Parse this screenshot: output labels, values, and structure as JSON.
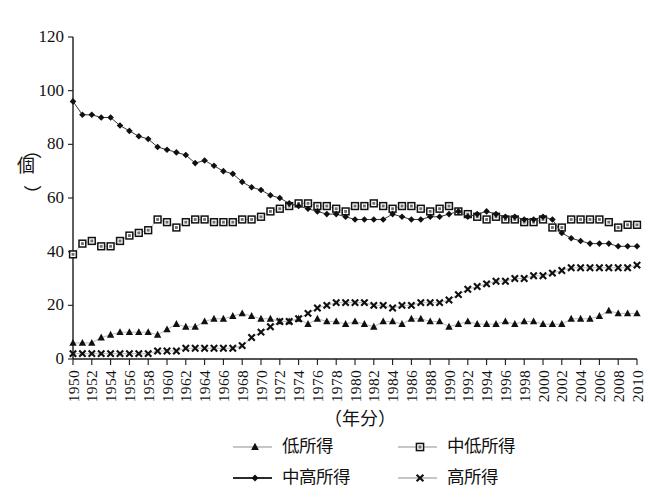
{
  "chart_data": {
    "type": "line",
    "title": "",
    "xlabel": "（年分）",
    "ylabel": "（個）",
    "ylim": [
      0,
      120
    ],
    "ytick_values": [
      0,
      20,
      40,
      60,
      80,
      100,
      120
    ],
    "xlim": [
      1950,
      2010
    ],
    "xtick_labels": [
      "1950",
      "1952",
      "1954",
      "1956",
      "1958",
      "1960",
      "1962",
      "1964",
      "1966",
      "1968",
      "1970",
      "1972",
      "1974",
      "1976",
      "1978",
      "1980",
      "1982",
      "1984",
      "1986",
      "1988",
      "1990",
      "1992",
      "1994",
      "1996",
      "1998",
      "2000",
      "2002",
      "2004",
      "2006",
      "2008",
      "2010"
    ],
    "grid": false,
    "legend_position": "bottom",
    "x": [
      1950,
      1951,
      1952,
      1953,
      1954,
      1955,
      1956,
      1957,
      1958,
      1959,
      1960,
      1961,
      1962,
      1963,
      1964,
      1965,
      1966,
      1967,
      1968,
      1969,
      1970,
      1971,
      1972,
      1973,
      1974,
      1975,
      1976,
      1977,
      1978,
      1979,
      1980,
      1981,
      1982,
      1983,
      1984,
      1985,
      1986,
      1987,
      1988,
      1989,
      1990,
      1991,
      1992,
      1993,
      1994,
      1995,
      1996,
      1997,
      1998,
      1999,
      2000,
      2001,
      2002,
      2003,
      2004,
      2005,
      2006,
      2007,
      2008,
      2009,
      2010
    ],
    "series": [
      {
        "name": "低所得",
        "marker": "triangle",
        "values": [
          6,
          6,
          6,
          8,
          9,
          10,
          10,
          10,
          10,
          9,
          11,
          13,
          12,
          12,
          14,
          15,
          15,
          16,
          17,
          16,
          15,
          15,
          14,
          14,
          15,
          13,
          15,
          14,
          14,
          13,
          14,
          13,
          12,
          14,
          14,
          13,
          15,
          15,
          14,
          14,
          12,
          13,
          14,
          13,
          13,
          13,
          14,
          13,
          14,
          14,
          13,
          13,
          13,
          15,
          15,
          15,
          16,
          18,
          17,
          17,
          17
        ]
      },
      {
        "name": "中低所得",
        "marker": "square",
        "values": [
          39,
          43,
          44,
          42,
          42,
          44,
          46,
          47,
          48,
          52,
          51,
          49,
          51,
          52,
          52,
          51,
          51,
          51,
          52,
          52,
          53,
          55,
          56,
          57,
          58,
          58,
          57,
          57,
          56,
          55,
          57,
          57,
          58,
          57,
          56,
          57,
          57,
          56,
          55,
          56,
          57,
          55,
          54,
          53,
          52,
          53,
          52,
          52,
          51,
          51,
          52,
          49,
          49,
          52,
          52,
          52,
          52,
          51,
          49,
          50,
          50
        ]
      },
      {
        "name": "中高所得",
        "marker": "diamond",
        "values": [
          96,
          91,
          91,
          90,
          90,
          87,
          85,
          83,
          82,
          79,
          78,
          77,
          76,
          73,
          74,
          72,
          70,
          69,
          66,
          64,
          63,
          61,
          60,
          58,
          57,
          56,
          55,
          54,
          54,
          53,
          52,
          52,
          52,
          52,
          54,
          53,
          52,
          52,
          53,
          53,
          54,
          55,
          53,
          54,
          55,
          54,
          53,
          53,
          52,
          52,
          53,
          52,
          47,
          45,
          44,
          43,
          43,
          43,
          42,
          42,
          42
        ]
      },
      {
        "name": "高所得",
        "marker": "x",
        "values": [
          2,
          2,
          2,
          2,
          2,
          2,
          2,
          2,
          2,
          3,
          3,
          3,
          4,
          4,
          4,
          4,
          4,
          4,
          5,
          8,
          10,
          12,
          14,
          14,
          15,
          17,
          19,
          20,
          21,
          21,
          21,
          21,
          20,
          20,
          19,
          20,
          20,
          21,
          21,
          21,
          22,
          24,
          26,
          27,
          28,
          29,
          29,
          30,
          30,
          31,
          31,
          32,
          33,
          34,
          34,
          34,
          34,
          34,
          34,
          34,
          35
        ]
      }
    ]
  },
  "legend": {
    "items": [
      {
        "label": "低所得",
        "marker": "triangle"
      },
      {
        "label": "中低所得",
        "marker": "square"
      },
      {
        "label": "中高所得",
        "marker": "diamond"
      },
      {
        "label": "高所得",
        "marker": "x"
      }
    ]
  },
  "colors": {
    "ink": "#101010",
    "light_line": "#b9b9b9",
    "dark_line": "#3a3a3a",
    "background": "#ffffff"
  }
}
